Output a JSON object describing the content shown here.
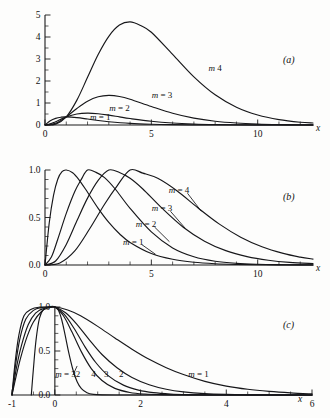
{
  "figure": {
    "background_color": "#fdfdfc",
    "ink_color": "#17171a",
    "panels": [
      "a",
      "b",
      "c"
    ]
  },
  "panel_a": {
    "label": "(a)",
    "xlabel": "x",
    "x_ticklabels": [
      "0",
      "5",
      "10"
    ],
    "y_ticklabels": [
      "0",
      "1",
      "2",
      "3",
      "4",
      "5"
    ],
    "curve_labels": [
      "m = 1",
      "m = 2",
      "m = 3",
      "m  4"
    ]
  },
  "panel_b": {
    "label": "(b)",
    "xlabel": "x",
    "x_ticklabels": [
      "0",
      "5",
      "10"
    ],
    "y_ticklabels": [
      "0.0",
      "0.5",
      "1.0"
    ],
    "curve_labels": [
      "m = 1",
      "m = 2",
      "m = 3",
      "m = 4"
    ]
  },
  "panel_c": {
    "label": "(c)",
    "xlabel": "x",
    "x_ticklabels": [
      "-1",
      "0",
      "2",
      "4",
      "6"
    ],
    "y_ticklabels": [
      "0.0",
      "0.5",
      "1.0"
    ],
    "curve_labels": [
      "m = 32",
      "4",
      "3",
      "2",
      "m = 1"
    ]
  },
  "chart_data": [
    {
      "type": "line",
      "title": "",
      "panel": "(a)",
      "xlabel": "x",
      "ylabel": "",
      "xlim": [
        0,
        12.6
      ],
      "ylim": [
        0,
        5
      ],
      "xticks": [
        0,
        5,
        10
      ],
      "xticks_minor_step": 1,
      "yticks": [
        0,
        1,
        2,
        3,
        4,
        5
      ],
      "yticks_minor_step": 0.5,
      "grid": false,
      "legend": "inline-labels",
      "series": [
        {
          "name": "m = 1",
          "label_xy": [
            2.6,
            0.22
          ],
          "peak_xy": [
            1.0,
            0.37
          ],
          "x": [
            0,
            0.25,
            0.5,
            0.75,
            1.0,
            1.5,
            2.0,
            2.5,
            3.0,
            4.0,
            5.0,
            6.0,
            7.0,
            8.0,
            9.0,
            10.0,
            11.0,
            12.0,
            12.6
          ],
          "y": [
            0,
            0.195,
            0.303,
            0.354,
            0.368,
            0.335,
            0.271,
            0.205,
            0.149,
            0.073,
            0.034,
            0.0149,
            0.0064,
            0.0027,
            0.0011,
            0.00045,
            0.00018,
            7e-05,
            4e-05
          ]
        },
        {
          "name": "m = 2",
          "label_xy": [
            3.5,
            0.63
          ],
          "peak_xy": [
            2.0,
            0.541
          ],
          "x": [
            0,
            0.25,
            0.5,
            1.0,
            1.5,
            2.0,
            2.5,
            3.0,
            3.5,
            4.0,
            5.0,
            6.0,
            7.0,
            8.0,
            9.0,
            10.0,
            11.0,
            12.0,
            12.6
          ],
          "y": [
            0,
            0.049,
            0.152,
            0.368,
            0.502,
            0.541,
            0.513,
            0.448,
            0.37,
            0.293,
            0.168,
            0.089,
            0.045,
            0.0215,
            0.01,
            0.0045,
            0.002,
            0.00089,
            0.00053
          ]
        },
        {
          "name": "m = 3",
          "label_xy": [
            5.5,
            1.25
          ],
          "peak_xy": [
            3.0,
            1.344
          ],
          "x": [
            0,
            0.5,
            1.0,
            1.5,
            2.0,
            2.5,
            3.0,
            3.5,
            4.0,
            5.0,
            6.0,
            7.0,
            8.0,
            9.0,
            10.0,
            11.0,
            12.0,
            12.6
          ],
          "y": [
            0,
            0.076,
            0.368,
            0.753,
            1.083,
            1.282,
            1.344,
            1.297,
            1.172,
            0.842,
            0.535,
            0.313,
            0.172,
            0.09,
            0.045,
            0.0221,
            0.0106,
            0.0066
          ]
        },
        {
          "name": "m  4",
          "label_xy": [
            8.0,
            2.45
          ],
          "peak_xy": [
            4.0,
            4.688
          ],
          "x": [
            0,
            0.5,
            1.0,
            1.5,
            2.0,
            2.5,
            3.0,
            3.5,
            4.0,
            4.5,
            5.0,
            6.0,
            7.0,
            8.0,
            9.0,
            10.0,
            11.0,
            12.0,
            12.6
          ],
          "y": [
            0,
            0.038,
            0.368,
            1.13,
            2.166,
            3.205,
            4.032,
            4.541,
            4.688,
            4.52,
            4.214,
            3.21,
            2.19,
            1.373,
            0.81,
            0.454,
            0.245,
            0.127,
            0.092
          ]
        }
      ]
    },
    {
      "type": "line",
      "title": "",
      "panel": "(b)",
      "xlabel": "x",
      "ylabel": "",
      "xlim": [
        0,
        12.6
      ],
      "ylim": [
        0,
        1.0
      ],
      "xticks": [
        0,
        5,
        10
      ],
      "xticks_minor_step": 1,
      "yticks": [
        0.0,
        0.5,
        1.0
      ],
      "yticks_minor_step": 0.1,
      "grid": false,
      "legend": "inline-labels-with-leaders",
      "note": "each curve normalized to unit peak; peak at x = m",
      "series": [
        {
          "name": "m = 1",
          "peak_xy": [
            1.0,
            1.0
          ],
          "label_xy": [
            4.15,
            0.215
          ],
          "x": [
            0,
            0.2,
            0.4,
            0.6,
            0.8,
            1.0,
            1.3,
            1.6,
            2.0,
            2.5,
            3.0,
            3.5,
            4.0,
            5.0,
            6.0,
            7.0,
            8.0,
            9.0,
            10.0,
            11.0,
            12.0,
            12.6
          ],
          "y": [
            0,
            0.445,
            0.733,
            0.903,
            0.982,
            1.0,
            0.971,
            0.897,
            0.766,
            0.596,
            0.448,
            0.329,
            0.238,
            0.121,
            0.06,
            0.029,
            0.0137,
            0.0064,
            0.003,
            0.0014,
            0.00063,
            0.00038
          ]
        },
        {
          "name": "m = 2",
          "peak_xy": [
            2.0,
            1.0
          ],
          "label_xy": [
            4.75,
            0.4
          ],
          "x": [
            0,
            0.3,
            0.6,
            1.0,
            1.4,
            1.7,
            2.0,
            2.4,
            2.8,
            3.3,
            4.0,
            5.0,
            6.0,
            7.0,
            8.0,
            9.0,
            10.0,
            11.0,
            12.0,
            12.6
          ],
          "y": [
            0,
            0.083,
            0.271,
            0.543,
            0.773,
            0.899,
            1.0,
            0.975,
            0.92,
            0.8,
            0.596,
            0.348,
            0.18,
            0.087,
            0.04,
            0.0178,
            0.0078,
            0.0034,
            0.0014,
            0.00088
          ]
        },
        {
          "name": "m = 3",
          "peak_xy": [
            3.0,
            1.0
          ],
          "label_xy": [
            5.5,
            0.565
          ],
          "x": [
            0,
            0.5,
            1.0,
            1.5,
            2.0,
            2.5,
            3.0,
            3.5,
            4.0,
            4.6,
            5.5,
            6.5,
            7.5,
            8.5,
            9.5,
            10.5,
            11.5,
            12.6
          ],
          "y": [
            0,
            0.042,
            0.216,
            0.465,
            0.704,
            0.891,
            1.0,
            0.974,
            0.913,
            0.8,
            0.598,
            0.398,
            0.251,
            0.151,
            0.088,
            0.05,
            0.0275,
            0.0145
          ]
        },
        {
          "name": "m = 4",
          "peak_xy": [
            4.0,
            1.0
          ],
          "label_xy": [
            6.3,
            0.755
          ],
          "x": [
            0,
            0.7,
            1.4,
            2.1,
            2.8,
            3.4,
            4.0,
            4.6,
            5.3,
            6.2,
            7.2,
            8.2,
            9.2,
            10.2,
            11.2,
            12.0,
            12.6
          ],
          "y": [
            0,
            0.022,
            0.148,
            0.381,
            0.64,
            0.836,
            1.0,
            0.967,
            0.912,
            0.781,
            0.6,
            0.43,
            0.293,
            0.192,
            0.122,
            0.083,
            0.062
          ]
        }
      ]
    },
    {
      "type": "line",
      "title": "",
      "panel": "(c)",
      "xlabel": "x",
      "ylabel": "",
      "xlim": [
        -1,
        6
      ],
      "ylim": [
        0,
        1.0
      ],
      "xticks": [
        -1,
        0,
        2,
        4,
        6
      ],
      "xticks_minor_step": 0.5,
      "yticks": [
        0.0,
        0.5,
        1.0
      ],
      "yticks_minor_step": 0.1,
      "grid": false,
      "legend": "inline-labels-with-leaders",
      "note": "all curves normalized to unit peak at x = 0; larger m gives narrower peak",
      "series": [
        {
          "name": "m = 1",
          "label_xy": [
            3.35,
            0.205
          ],
          "x": [
            -1.0,
            -0.9,
            -0.8,
            -0.65,
            -0.5,
            -0.3,
            -0.15,
            0,
            0.3,
            0.6,
            1.0,
            1.4,
            1.8,
            2.2,
            2.6,
            3.0,
            3.5,
            4.0,
            4.5,
            5.0,
            5.5,
            6.0
          ],
          "y": [
            0,
            0.22,
            0.42,
            0.66,
            0.83,
            0.955,
            0.99,
            1.0,
            0.965,
            0.9,
            0.78,
            0.648,
            0.52,
            0.405,
            0.31,
            0.232,
            0.155,
            0.101,
            0.065,
            0.041,
            0.024,
            0.012
          ]
        },
        {
          "name": "2",
          "label_xy": [
            1.55,
            0.205
          ],
          "x": [
            -1.0,
            -0.9,
            -0.78,
            -0.62,
            -0.45,
            -0.25,
            -0.1,
            0,
            0.25,
            0.5,
            0.8,
            1.1,
            1.45,
            1.8,
            2.2,
            2.6,
            3.0,
            3.5,
            4.0,
            4.6,
            5.2,
            6.0
          ],
          "y": [
            0,
            0.3,
            0.56,
            0.8,
            0.93,
            0.987,
            0.998,
            1.0,
            0.935,
            0.812,
            0.63,
            0.46,
            0.31,
            0.2,
            0.117,
            0.066,
            0.036,
            0.0155,
            0.0065,
            0.0022,
            0.0008,
            0.0002
          ]
        },
        {
          "name": "3",
          "label_xy": [
            1.2,
            0.205
          ],
          "x": [
            -1.0,
            -0.92,
            -0.82,
            -0.68,
            -0.5,
            -0.3,
            -0.12,
            0,
            0.22,
            0.45,
            0.7,
            0.95,
            1.25,
            1.6,
            1.95,
            2.3,
            2.7,
            3.1,
            3.6,
            4.2,
            5.0,
            6.0
          ],
          "y": [
            0,
            0.33,
            0.63,
            0.86,
            0.962,
            0.995,
            1.0,
            1.0,
            0.915,
            0.755,
            0.55,
            0.372,
            0.218,
            0.112,
            0.056,
            0.027,
            0.0115,
            0.0048,
            0.0016,
            0.0004,
            0.0001,
            0.0
          ]
        },
        {
          "name": "4",
          "label_xy": [
            0.9,
            0.205
          ],
          "x": [
            -1.0,
            -0.93,
            -0.84,
            -0.72,
            -0.55,
            -0.35,
            -0.15,
            0,
            0.2,
            0.4,
            0.62,
            0.85,
            1.1,
            1.4,
            1.75,
            2.1,
            2.5,
            3.0,
            3.6,
            4.4,
            5.2,
            6.0
          ],
          "y": [
            0,
            0.36,
            0.68,
            0.9,
            0.975,
            0.998,
            1.0,
            1.0,
            0.9,
            0.715,
            0.49,
            0.3,
            0.165,
            0.075,
            0.029,
            0.011,
            0.0035,
            0.0009,
            0.0002,
            0.0,
            0.0,
            0.0
          ]
        },
        {
          "name": "m = 32",
          "label_xy": [
            0.3,
            0.205
          ],
          "x": [
            -0.55,
            -0.5,
            -0.44,
            -0.36,
            -0.26,
            -0.14,
            -0.05,
            0,
            0.08,
            0.16,
            0.24,
            0.32,
            0.42,
            0.52,
            0.62,
            0.75,
            0.9,
            1.1,
            1.5,
            2.0,
            3.0,
            6.0
          ],
          "y": [
            0,
            0.3,
            0.62,
            0.87,
            0.975,
            0.999,
            1.0,
            1.0,
            0.965,
            0.855,
            0.68,
            0.49,
            0.29,
            0.15,
            0.072,
            0.026,
            0.0075,
            0.0015,
            0.0001,
            0.0,
            0.0,
            0.0
          ]
        }
      ]
    }
  ]
}
